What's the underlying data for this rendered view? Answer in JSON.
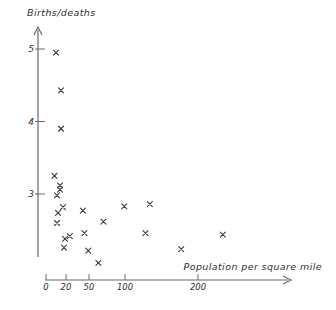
{
  "chart_data": {
    "type": "scatter",
    "title": "",
    "ylabel": "Births/deaths",
    "xlabel": "Population per square mile",
    "marker": "x",
    "grid": false,
    "legend": null,
    "x_ticks": [
      0,
      20,
      50,
      100,
      200
    ],
    "y_ticks": [
      5,
      4,
      3
    ],
    "x_range_shown": [
      0,
      330
    ],
    "y_range_shown": [
      1.9,
      5.2
    ],
    "points": [
      {
        "x": 10,
        "y": 4.95
      },
      {
        "x": 15,
        "y": 4.43
      },
      {
        "x": 15,
        "y": 3.9
      },
      {
        "x": 8.5,
        "y": 3.25
      },
      {
        "x": 14,
        "y": 3.12
      },
      {
        "x": 14,
        "y": 3.06
      },
      {
        "x": 11,
        "y": 2.98
      },
      {
        "x": 17,
        "y": 2.82
      },
      {
        "x": 12,
        "y": 2.74
      },
      {
        "x": 42,
        "y": 2.77
      },
      {
        "x": 11,
        "y": 2.6
      },
      {
        "x": 70,
        "y": 2.62
      },
      {
        "x": 44,
        "y": 2.46
      },
      {
        "x": 25,
        "y": 2.42
      },
      {
        "x": 19,
        "y": 2.38
      },
      {
        "x": 18,
        "y": 2.26
      },
      {
        "x": 49,
        "y": 2.22
      },
      {
        "x": 63,
        "y": 2.05
      },
      {
        "x": 99,
        "y": 2.83
      },
      {
        "x": 134,
        "y": 2.86
      },
      {
        "x": 128,
        "y": 2.46
      },
      {
        "x": 234,
        "y": 2.44
      },
      {
        "x": 177,
        "y": 2.24
      }
    ]
  },
  "layout": {
    "ink_color": "#3a3a3a",
    "axis_color": "#6a6a6a",
    "background": "#ffffff",
    "x_tick_px": [
      46,
      66,
      89,
      125,
      198
    ],
    "y_tick_px": [
      49,
      121.5,
      194
    ],
    "x_axis": {
      "y_px": 280,
      "from_px": 45,
      "to_px": 291
    },
    "y_axis": {
      "x_px": 38,
      "from_px": 27,
      "to_px": 257
    },
    "marker_half_size": 2.5
  }
}
